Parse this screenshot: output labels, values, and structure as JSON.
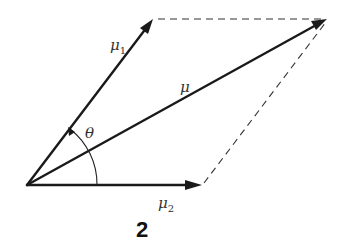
{
  "figure": {
    "number": "2",
    "origin": {
      "x": 27,
      "y": 185
    },
    "vectors": {
      "mu1": {
        "symbol": "μ",
        "subscript": "1",
        "tip": {
          "x": 153,
          "y": 19
        }
      },
      "mu": {
        "symbol": "μ",
        "subscript": "",
        "tip": {
          "x": 327,
          "y": 19
        }
      },
      "mu2": {
        "symbol": "μ",
        "subscript": "2",
        "tip": {
          "x": 202,
          "y": 185
        }
      }
    },
    "angle": {
      "symbol": "θ",
      "between": [
        "mu2",
        "mu1"
      ]
    },
    "construction": "parallelogram (dashed sides)",
    "colors": {
      "stroke": "#1a1a1a",
      "background": "#ffffff"
    }
  }
}
